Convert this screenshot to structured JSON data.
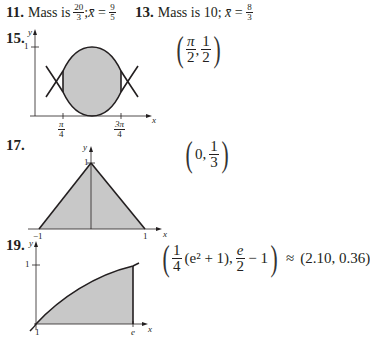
{
  "problems": [
    {
      "number": "11.",
      "text_prefix": "Mass is ",
      "mass_fraction": {
        "numerator": "20",
        "denominator": "3"
      },
      "separator": "; ",
      "xbar_label": "x̄",
      "equals": " = ",
      "xbar_fraction": {
        "numerator": "9",
        "denominator": "5"
      }
    },
    {
      "number": "13.",
      "text_prefix": "Mass is ",
      "mass_value": "10",
      "separator": "; ",
      "xbar_label": "x̄",
      "equals": " = ",
      "xbar_fraction": {
        "numerator": "8",
        "denominator": "3"
      }
    },
    {
      "number": "15.",
      "graph": {
        "y_label": "y",
        "x_label": "x",
        "y_tick": "1",
        "x_ticks": [
          {
            "numerator": "π",
            "denominator": "4"
          },
          {
            "numerator": "3π",
            "denominator": "4"
          }
        ]
      },
      "answer": {
        "x": {
          "numerator": "π",
          "denominator": "2"
        },
        "comma": ",",
        "y": {
          "numerator": "1",
          "denominator": "2"
        }
      }
    },
    {
      "number": "17.",
      "graph": {
        "y_label": "y",
        "x_label": "x",
        "y_tick": "1",
        "x_ticks": [
          "−1",
          "1"
        ]
      },
      "answer": {
        "x": "0",
        "comma": ",",
        "y": {
          "numerator": "1",
          "denominator": "3"
        }
      }
    },
    {
      "number": "19.",
      "graph": {
        "y_label": "y",
        "x_label": "x",
        "y_tick": "1",
        "x_ticks": [
          "1",
          "e"
        ]
      },
      "answer": {
        "x_coef": {
          "numerator": "1",
          "denominator": "4"
        },
        "x_expr": "(e² + 1)",
        "comma": ",",
        "y_frac": {
          "numerator": "e",
          "denominator": "2"
        },
        "y_rest": " − 1",
        "approx": "≈",
        "approx_value": "(2.10, 0.36)"
      }
    }
  ],
  "colors": {
    "ink": "#231f20",
    "shade": "#c8c8c8"
  }
}
